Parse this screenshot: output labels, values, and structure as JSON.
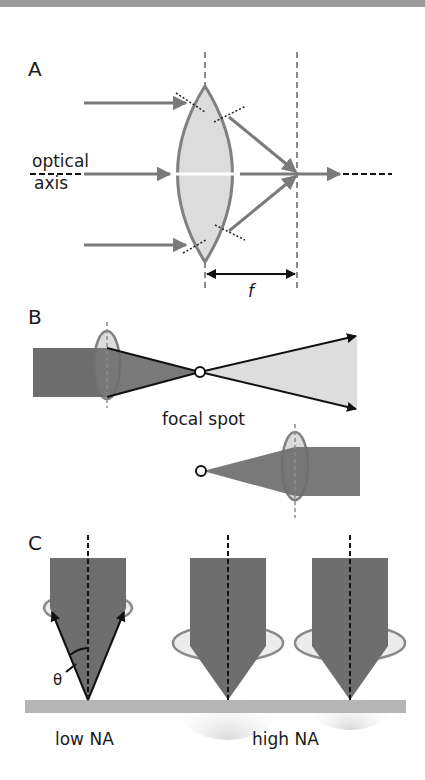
{
  "figure": {
    "panels": [
      {
        "id": "A",
        "label": "A",
        "axis_label_line1": "optical",
        "axis_label_line2": "axis",
        "focal_length_label": "f"
      },
      {
        "id": "B",
        "label": "B",
        "focal_spot_label": "focal spot"
      },
      {
        "id": "C",
        "label": "C",
        "angle_label": "θ",
        "low_na_label": "low NA",
        "high_na_label": "high NA"
      }
    ],
    "colors": {
      "ray_gray": "#7a7a7a",
      "lens_fill": "#dcdcdc",
      "lens_stroke": "#808080",
      "beam_dark": "#6e6e6e",
      "beam_light": "#dddddd",
      "ground": "#b5b5b5",
      "black": "#111111",
      "top_bar": "#9a9a9a"
    }
  }
}
